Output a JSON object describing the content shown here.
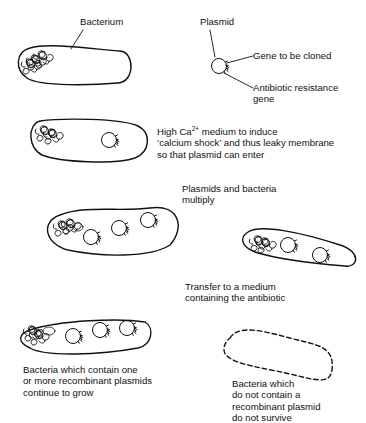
{
  "labels": {
    "bacterium": "Bacterium",
    "plasmid": "Plasmid",
    "gene_to_clone": "Gene to be cloned",
    "resistance_gene_1": "Antibiotic resistance",
    "resistance_gene_2": "gene",
    "step1_pre": "High Ca",
    "step1_sup": "2+",
    "step1_post": " medium to induce",
    "step1_line2": "‘calcium shock’ and thus leaky membrane",
    "step1_line3": "so that plasmid can enter",
    "step2_line1": "Plasmids and bacteria",
    "step2_line2": "multiply",
    "step3_line1": "Transfer to a medium",
    "step3_line2": "containing the antibiotic",
    "survive_line1": "Bacteria which contain one",
    "survive_line2": "or more recombinant plasmids",
    "survive_line3": "continue to grow",
    "die_line1": "Bacteria which",
    "die_line2": "do not contain a",
    "die_line3": "recombinant plasmid",
    "die_line4": "do not survive"
  },
  "colors": {
    "stroke": "#111111",
    "background": "#ffffff"
  }
}
